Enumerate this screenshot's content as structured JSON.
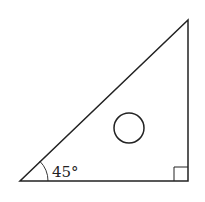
{
  "figure": {
    "angle_label": "45°",
    "stroke_color": "#222222",
    "background": "#ffffff",
    "shapes": {
      "triangle": {
        "vertices": [
          [
            20,
            181
          ],
          [
            188,
            181
          ],
          [
            188,
            20
          ]
        ]
      },
      "right_angle_marker": {
        "x": 174,
        "y": 167,
        "size": 14
      },
      "angle_arc": {
        "cx": 20,
        "cy": 181,
        "r": 28
      },
      "circle": {
        "cx": 129,
        "cy": 128,
        "r": 15
      }
    }
  }
}
